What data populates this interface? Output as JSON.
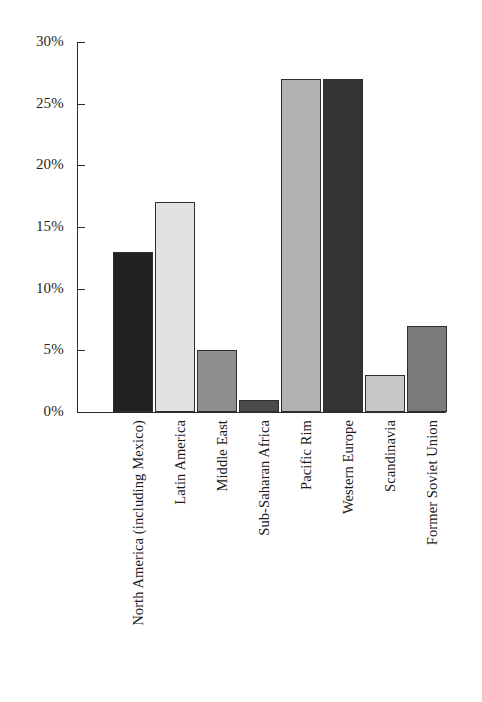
{
  "chart_data": {
    "type": "bar",
    "title": "",
    "xlabel": "",
    "ylabel": "",
    "ylim": [
      0,
      30
    ],
    "grid": false,
    "legend": null,
    "y_tick_labels": [
      "30%",
      "25%",
      "20%",
      "15%",
      "10%",
      "5%",
      "0%"
    ],
    "y_tick_values": [
      30,
      25,
      20,
      15,
      10,
      5,
      0
    ],
    "value_suffix": "%",
    "categories": [
      "North America (including Mexico)",
      "Latin America",
      "Middle East",
      "Sub-Saharan Africa",
      "Pacific Rim",
      "Western Europe",
      "Scandinavia",
      "Former Soviet Union"
    ],
    "values": [
      13,
      17,
      5,
      1,
      27,
      27,
      3,
      7
    ],
    "bar_colors": [
      "#222222",
      "#e2e2e2",
      "#8f8f8f",
      "#4a4a4a",
      "#b2b2b2",
      "#333333",
      "#c8c8c8",
      "#7b7b7b"
    ],
    "bar_border_color": "#2e2e2e",
    "axis_color": "#2b2b2b",
    "background_color": "#ffffff"
  }
}
